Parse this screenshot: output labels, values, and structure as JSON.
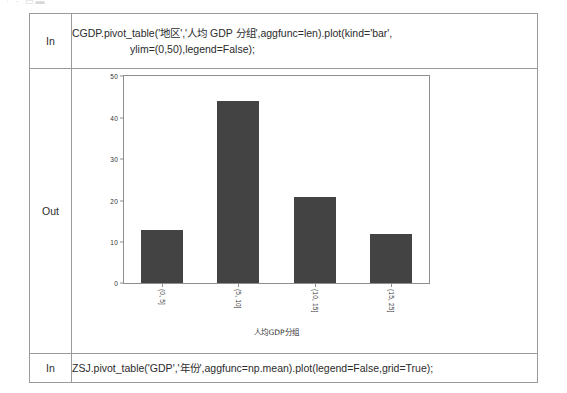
{
  "page": {
    "top_fragment": "· ·  ▭▬"
  },
  "notebook": {
    "rows": [
      {
        "label": "In",
        "kind": "code",
        "line1": "CGDP.pivot_table('地区','人均 GDP 分组',aggfunc=len).plot(kind='bar',",
        "line2": "ylim=(0,50),legend=False);"
      },
      {
        "label": "Out",
        "kind": "figure"
      },
      {
        "label": "In",
        "kind": "code",
        "line1": "ZSJ.pivot_table('GDP','年份',aggfunc=np.mean).plot(legend=False,grid=True);",
        "line2": ""
      }
    ]
  },
  "chart_data": {
    "type": "bar",
    "title": "",
    "xlabel": "人均GDP分组",
    "ylabel": "",
    "categories": [
      "(0, 5]",
      "(5, 10]",
      "(10, 15]",
      "(15, 25]"
    ],
    "values": [
      13,
      44,
      21,
      12
    ],
    "ylim": [
      0,
      50
    ],
    "yticks": [
      0,
      10,
      20,
      30,
      40,
      50
    ],
    "grid": false,
    "legend": false,
    "bar_color": "#434343",
    "frame_color": "#8e8e8e",
    "xtick_rotation": 90
  }
}
